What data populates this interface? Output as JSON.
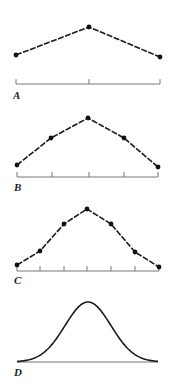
{
  "panels": [
    {
      "label": "A",
      "points": [
        [
          16,
          55
        ],
        [
          89,
          27
        ],
        [
          160,
          57
        ]
      ],
      "ticks": [
        16,
        89,
        160
      ],
      "axis_y": 84,
      "label_pos": [
        13,
        90
      ],
      "line_style": "dashed"
    },
    {
      "label": "B",
      "points": [
        [
          17,
          165
        ],
        [
          51,
          138
        ],
        [
          88,
          118
        ],
        [
          124,
          138
        ],
        [
          158,
          167
        ]
      ],
      "ticks": [
        17,
        52,
        89,
        124,
        158
      ],
      "axis_y": 177,
      "label_pos": [
        14,
        182
      ],
      "line_style": "dashed"
    },
    {
      "label": "C",
      "points": [
        [
          17,
          265
        ],
        [
          40,
          251
        ],
        [
          64,
          224
        ],
        [
          87,
          209
        ],
        [
          111,
          224
        ],
        [
          135,
          252
        ],
        [
          159,
          267
        ]
      ],
      "ticks": [
        17,
        40,
        64,
        87,
        111,
        135,
        159
      ],
      "axis_y": 271,
      "label_pos": [
        14,
        275
      ],
      "line_style": "dashed"
    },
    {
      "label": "D",
      "curve": {
        "x0": 17,
        "x1": 158,
        "peak_x": 88,
        "peak_y": 302,
        "base_y": 362,
        "sigma": 23
      },
      "axis_y": 362,
      "label_pos": [
        14,
        367
      ],
      "line_style": "solid"
    }
  ],
  "colors": {
    "line": "#1a1a1a",
    "axis": "#777777",
    "point": "#111111"
  }
}
